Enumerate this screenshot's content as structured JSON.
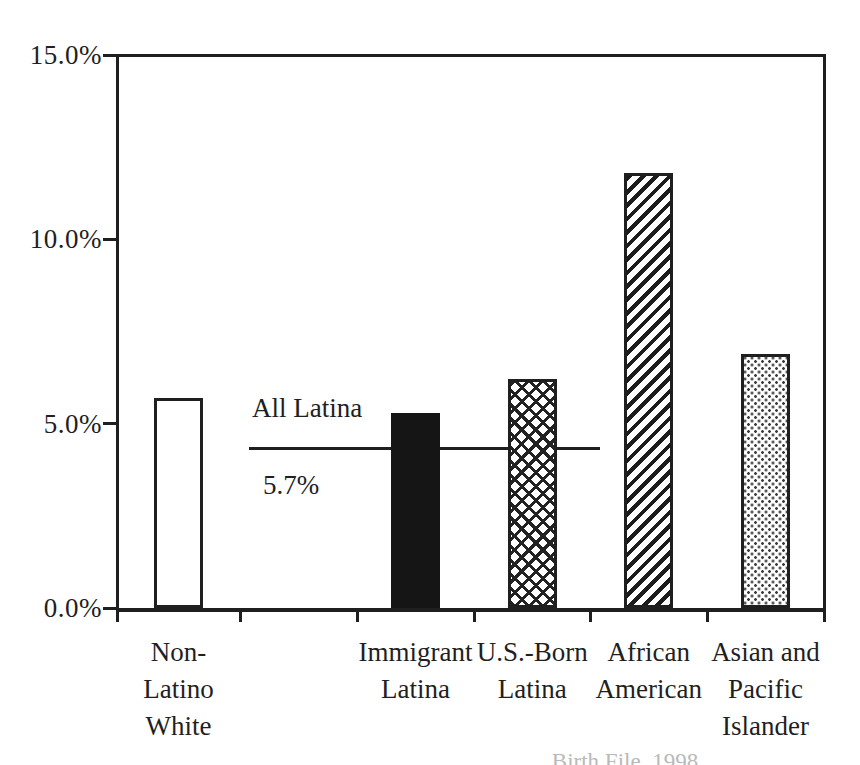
{
  "page": {
    "background": "#ffffff",
    "ink_color": "#1f1f1f"
  },
  "chart_data": {
    "type": "bar",
    "title": "",
    "xlabel": "",
    "ylabel": "",
    "ylim": [
      0,
      15
    ],
    "grid": false,
    "legend": "none",
    "y_axis": {
      "tick_labels": [
        "0.0%",
        "5.0%",
        "10.0%",
        "15.0%"
      ],
      "tick_values": [
        0,
        5,
        10,
        15
      ]
    },
    "categories": [
      "Non-Latino White",
      "Immigrant Latina",
      "U.S.-Born Latina",
      "African American",
      "Asian and Pacific Islander"
    ],
    "values": [
      5.7,
      5.3,
      6.2,
      11.8,
      6.9
    ],
    "bars": [
      {
        "name": "non-latino-white",
        "label_lines": [
          "Non-",
          "Latino",
          "White"
        ],
        "value": 5.7,
        "slot": 0,
        "pattern": "outline"
      },
      {
        "name": "immigrant-latina",
        "label_lines": [
          "Immigrant",
          "Latina"
        ],
        "value": 5.3,
        "slot": 2,
        "pattern": "solid"
      },
      {
        "name": "us-born-latina",
        "label_lines": [
          "U.S.-Born",
          "Latina"
        ],
        "value": 6.2,
        "slot": 3,
        "pattern": "crosshatch"
      },
      {
        "name": "african-american",
        "label_lines": [
          "African",
          "American"
        ],
        "value": 11.8,
        "slot": 4,
        "pattern": "diagonal"
      },
      {
        "name": "asian-pacific-islander",
        "label_lines": [
          "Asian and",
          "Pacific",
          "Islander"
        ],
        "value": 6.9,
        "slot": 5,
        "pattern": "dots"
      }
    ],
    "reference_line": {
      "label": "All Latina",
      "value_label": "5.7%",
      "drawn_at_percent": 4.36
    }
  },
  "caption": {
    "text": "Birth File, 1998"
  }
}
